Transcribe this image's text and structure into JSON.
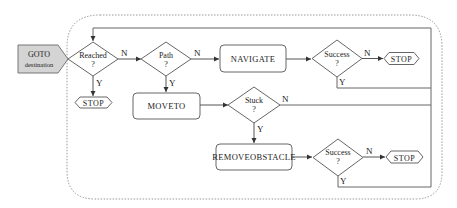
{
  "diagram": {
    "type": "flowchart",
    "entry": {
      "line1": "GOTO",
      "line2": "destination"
    },
    "decisions": {
      "reached": {
        "line1": "Reached",
        "line2": "?"
      },
      "path": {
        "line1": "Path",
        "line2": "?"
      },
      "success_navigate": {
        "line1": "Success",
        "line2": "?"
      },
      "stuck": {
        "line1": "Stuck",
        "line2": "?"
      },
      "success_remove": {
        "line1": "Success",
        "line2": "?"
      }
    },
    "processes": {
      "navigate": "NAVIGATE",
      "moveto": "MOVETO",
      "removeobstacle": "REMOVEOBSTACLE"
    },
    "terminals": {
      "stop_reached": "STOP",
      "stop_navigate": "STOP",
      "stop_remove": "STOP"
    },
    "edge_labels": {
      "yes": "Y",
      "no": "N"
    },
    "colors": {
      "line": "#555555",
      "entry_fill": "#d4d4d4",
      "dashed_border": "#999999"
    }
  }
}
